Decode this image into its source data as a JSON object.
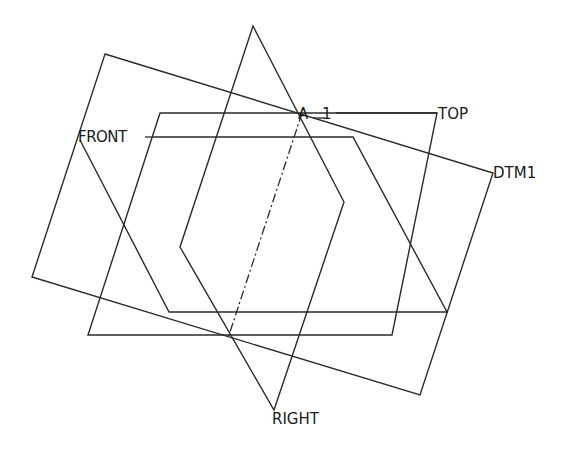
{
  "diagram": {
    "type": "cad-datum-planes",
    "stroke_color": "#2a2a2a",
    "background": "#ffffff",
    "planes": [
      {
        "name": "DTM1",
        "label": "DTM1",
        "points": "105,54 493,173 420,395 32,277",
        "label_pos": [
          493,
          178
        ]
      },
      {
        "name": "TOP",
        "label": "TOP",
        "points": "160,113 437,113 392,335 88,335",
        "label_pos": [
          438,
          118
        ]
      },
      {
        "name": "FRONT",
        "label": "FRONT",
        "points": "153,137 353,137 447,312 169,312 80,140",
        "label_pos": [
          78,
          142
        ]
      },
      {
        "name": "RIGHT",
        "label": "RIGHT",
        "points": "253,26 344,202 274,410 180,247",
        "label_pos": [
          273,
          421
        ]
      }
    ],
    "axis": {
      "name": "A_1",
      "label_a": "A",
      "label_num": "1",
      "start": [
        302,
        113
      ],
      "end": [
        228,
        338
      ],
      "label_pos": [
        300,
        119
      ]
    },
    "labels": {
      "dtm1": "DTM1",
      "top": "TOP",
      "front": "FRONT",
      "right": "RIGHT",
      "axis_letter": "A",
      "axis_number": "1"
    }
  }
}
